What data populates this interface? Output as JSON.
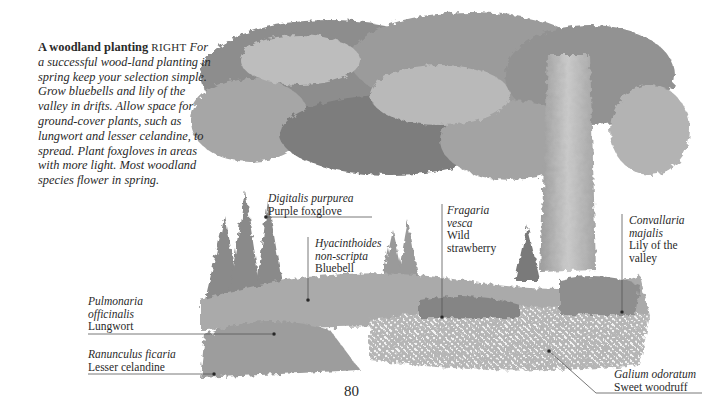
{
  "intro": {
    "title": "A woodland planting",
    "direction": "RIGHT",
    "body": "For a successful wood-land planting in spring keep your selection simple. Grow bluebells and lily of the valley in drifts. Allow space for ground-cover plants, such as lungwort and lesser celandine, to spread. Plant foxgloves in areas with more light. Most woodland species flower in spring."
  },
  "labels": [
    {
      "latin": "Digitalis purpurea",
      "common": "Purple foxglove"
    },
    {
      "latin": "Hyacinthoides non-scripta",
      "common": "Bluebell"
    },
    {
      "latin": "Fragaria vesca",
      "common": "Wild strawberry"
    },
    {
      "latin": "Convallaria majalis",
      "common": "Lily of the valley"
    },
    {
      "latin": "Pulmonaria officinalis",
      "common": "Lungwort"
    },
    {
      "latin": "Ranunculus ficaria",
      "common": "Lesser celandine"
    },
    {
      "latin": "Galium odoratum",
      "common": "Sweet woodruff"
    }
  ],
  "page_number": "80",
  "colors": {
    "ink": "#2a2a2a",
    "foliage_dark": "#6f6f6f",
    "foliage_mid": "#9a9a9a",
    "foliage_light": "#c8c8c8",
    "trunk": "#a9a9a9"
  }
}
